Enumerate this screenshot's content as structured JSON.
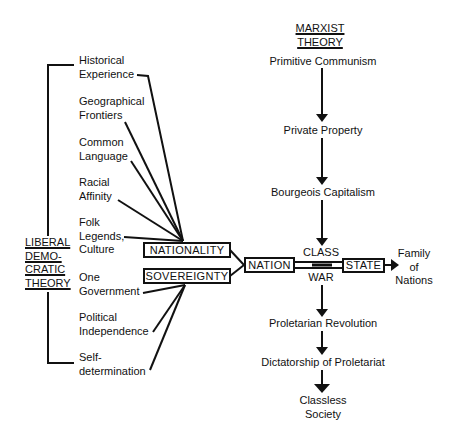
{
  "liberal": {
    "title_lines": [
      "LIBERAL",
      "DEMO-",
      "CRATIC",
      "THEORY"
    ],
    "factors": [
      {
        "lines": [
          "Historical",
          "Experience"
        ]
      },
      {
        "lines": [
          "Geographical",
          "Frontiers"
        ]
      },
      {
        "lines": [
          "Common",
          "Language"
        ]
      },
      {
        "lines": [
          "Racial",
          "Affinity"
        ]
      },
      {
        "lines": [
          "Folk",
          "Legends,",
          "Culture"
        ]
      },
      {
        "lines": [
          "One",
          "Government"
        ]
      },
      {
        "lines": [
          "Political",
          "Independence"
        ]
      },
      {
        "lines": [
          "Self-",
          "determination"
        ]
      }
    ],
    "nationality_box": "NATIONALITY",
    "sovereignty_box": "SOVEREIGNTY"
  },
  "center": {
    "nation_box": "NATION",
    "state_box": "STATE",
    "class_label": "CLASS",
    "war_label": "WAR",
    "outcome_lines": [
      "Family",
      "of",
      "Nations"
    ]
  },
  "marxist": {
    "title_lines": [
      "MARXIST",
      "THEORY"
    ],
    "stages": [
      "Primitive Communism",
      "Private Property",
      "Bourgeois Capitalism",
      "Proletarian Revolution",
      "Dictatorship of Proletariat"
    ],
    "final_stage_lines": [
      "Classless",
      "Society"
    ]
  },
  "colors": {
    "ink": "#111111",
    "background": "#ffffff"
  }
}
